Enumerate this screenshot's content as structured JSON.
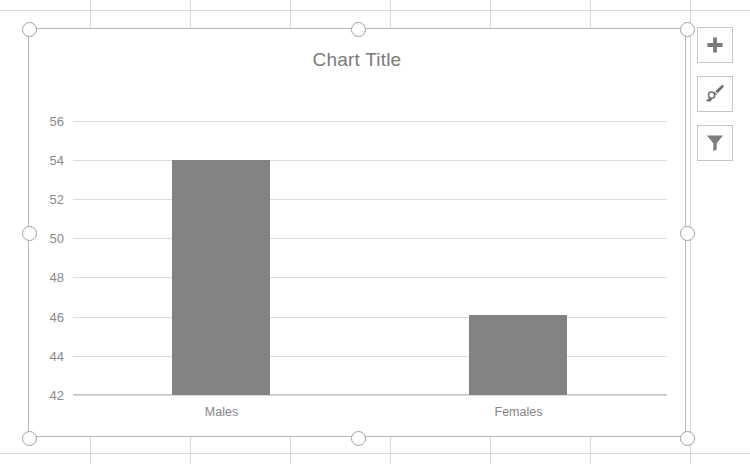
{
  "chart_data": {
    "type": "bar",
    "title": "Chart Title",
    "categories": [
      "Males",
      "Females"
    ],
    "values": [
      54,
      46.1
    ],
    "series": [
      {
        "name": "Series 1",
        "values": [
          54,
          46.1
        ]
      }
    ],
    "xlabel": "",
    "ylabel": "",
    "ylim": [
      42,
      57
    ],
    "yticks": [
      42,
      44,
      46,
      48,
      50,
      52,
      54,
      56
    ],
    "ytick_labels": [
      "42",
      "44",
      "46",
      "48",
      "50",
      "52",
      "54",
      "56"
    ],
    "grid": true,
    "legend": false,
    "bar_color": "#838383",
    "title_color": "#7b7b7b",
    "gridline_color": "#dcdcdc",
    "tick_label_color": "#8a8a8a"
  },
  "chart_object": {
    "selected": true,
    "border_color": "#b9b9b9",
    "handle_color": "#a0a0a0"
  },
  "side_buttons": [
    {
      "name": "chart-elements-button",
      "icon": "plus-icon",
      "label": "Chart Elements"
    },
    {
      "name": "chart-styles-button",
      "icon": "paintbrush-icon",
      "label": "Chart Styles"
    },
    {
      "name": "chart-filters-button",
      "icon": "funnel-icon",
      "label": "Chart Filters"
    }
  ],
  "sheet": {
    "grid_color": "#d9d9d9",
    "v_lines": [
      90,
      190,
      290,
      390,
      490,
      590,
      690
    ],
    "h_lines": [
      10,
      453
    ]
  }
}
